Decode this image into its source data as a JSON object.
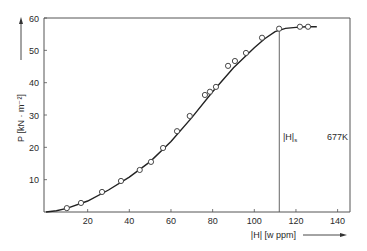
{
  "chart_data": {
    "type": "scatter",
    "title": "",
    "xlabel": "|H| [w ppm]",
    "ylabel": "P [kN · m⁻²]",
    "xlim": [
      0,
      145
    ],
    "ylim": [
      0,
      60
    ],
    "xticks": [
      20,
      40,
      60,
      80,
      100,
      120,
      140
    ],
    "yticks": [
      10,
      20,
      30,
      40,
      50,
      60
    ],
    "grid": false,
    "series": [
      {
        "name": "measured",
        "marker": "open-circle",
        "x": [
          10,
          16.8,
          26.9,
          36,
          45,
          50.4,
          56.2,
          62.9,
          69,
          76.3,
          78.7,
          81.6,
          87.4,
          90.7,
          96,
          103.7,
          111.9,
          121.9,
          125.8
        ],
        "y": [
          1.2,
          2.8,
          6.2,
          9.6,
          13,
          15.5,
          19.8,
          25,
          29.7,
          36.2,
          37.2,
          38.7,
          45.2,
          46.7,
          49.2,
          53.9,
          56.7,
          57.3,
          57.3
        ]
      },
      {
        "name": "fit curve",
        "type": "line",
        "x": [
          0,
          5,
          10,
          20,
          30,
          40,
          50,
          60,
          70,
          80,
          90,
          100,
          105,
          110,
          115,
          120,
          125,
          130
        ],
        "y": [
          0,
          0.4,
          1.1,
          3.4,
          6.8,
          10.8,
          15.6,
          21.8,
          29.2,
          37.2,
          44.6,
          50.8,
          53.6,
          55.8,
          56.8,
          57.1,
          57.3,
          57.3
        ]
      }
    ],
    "annotations": [
      {
        "text": "|H|s",
        "x": 112,
        "type": "vertical-line"
      },
      {
        "text": "677K"
      }
    ]
  },
  "labels": {
    "y_axis": "P [kN · m⁻²]",
    "x_axis": "|H| [w ppm]",
    "hs_label": "|H|",
    "hs_sub": "s",
    "temp": "677K"
  }
}
